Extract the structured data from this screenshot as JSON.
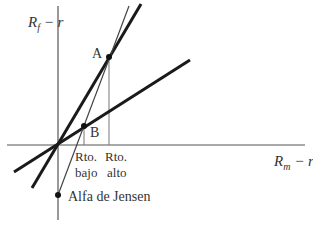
{
  "diagram": {
    "y_axis_label": {
      "main": "R",
      "sub": "f",
      "rest": " − r"
    },
    "x_axis_label": {
      "main": "R",
      "sub": "m",
      "rest": " − r"
    },
    "points": {
      "A": "A",
      "B": "B"
    },
    "tick_labels": {
      "low": {
        "line1": "Rto.",
        "line2": "bajo"
      },
      "high": {
        "line1": "Rto.",
        "line2": "alto"
      }
    },
    "annotation": "Alfa de Jensen",
    "colors": {
      "thick_line": "#1a1a1a",
      "thin_line": "#444444",
      "axis": "#555555",
      "text": "#333333"
    }
  }
}
